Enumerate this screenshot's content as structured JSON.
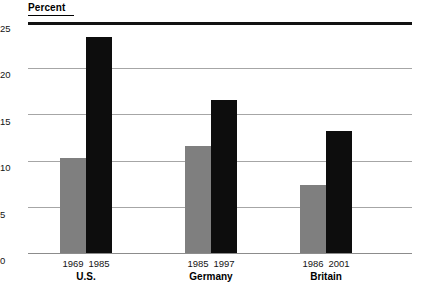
{
  "chart_data": {
    "type": "bar",
    "title": "",
    "ylabel": "Percent",
    "xlabel": "",
    "ylim": [
      0,
      25
    ],
    "yticks": [
      0,
      5,
      10,
      15,
      20,
      25
    ],
    "ytick_labels": [
      "0",
      "5",
      "10",
      "15",
      "20",
      "25"
    ],
    "grid": true,
    "legend": "none",
    "groups": [
      {
        "name": "U.S.",
        "bars": [
          {
            "label": "1969",
            "value": 10.4,
            "color": "#7f7f7f",
            "style": "gray"
          },
          {
            "label": "1985",
            "value": 23.4,
            "color": "#0d0d0d",
            "style": "black"
          }
        ]
      },
      {
        "name": "Germany",
        "bars": [
          {
            "label": "1985",
            "value": 11.6,
            "color": "#7f7f7f",
            "style": "gray"
          },
          {
            "label": "1997",
            "value": 16.6,
            "color": "#0d0d0d",
            "style": "black"
          }
        ]
      },
      {
        "name": "Britain",
        "bars": [
          {
            "label": "1986",
            "value": 7.4,
            "color": "#7f7f7f",
            "style": "gray"
          },
          {
            "label": "2001",
            "value": 13.3,
            "color": "#0d0d0d",
            "style": "black"
          }
        ]
      }
    ],
    "categories": [
      "U.S. 1969",
      "U.S. 1985",
      "Germany 1985",
      "Germany 1997",
      "Britain 1986",
      "Britain 2001"
    ],
    "values": [
      10.4,
      23.4,
      11.6,
      16.6,
      7.4,
      13.3
    ],
    "colors": {
      "gray_bar": "#7f7f7f",
      "black_bar": "#0d0d0d",
      "gridline": "#a6a6a6",
      "axis": "#111111"
    }
  }
}
